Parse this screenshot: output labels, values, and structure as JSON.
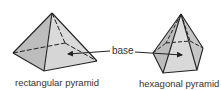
{
  "figures": [
    {
      "name": "rectangular pyramid",
      "label": "rectangular pyramid"
    },
    {
      "name": "hexagonal pyramid",
      "label": "hexagonal pyramid"
    }
  ],
  "callout": {
    "label": "base"
  },
  "colors": {
    "face_light": "#d9d9d9",
    "face_mid": "#c4c4c4",
    "face_dark": "#b0b0b0",
    "base": "#e6e6e6",
    "stroke": "#222222"
  }
}
